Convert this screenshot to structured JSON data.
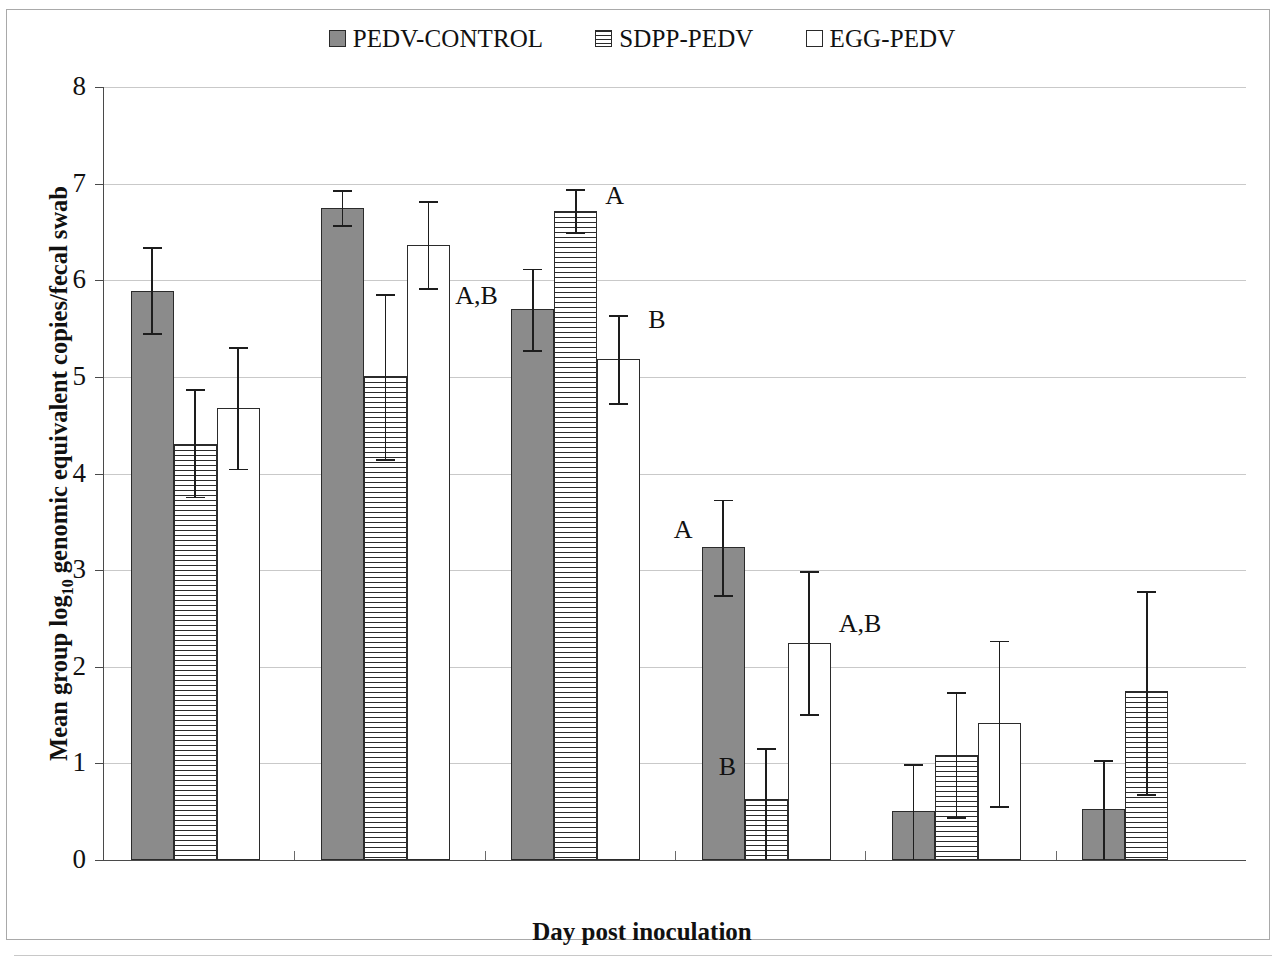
{
  "legend": {
    "items": [
      {
        "label": "PEDV-CONTROL",
        "swatch": "solid-gray-square-icon"
      },
      {
        "label": "SDPP-PEDV",
        "swatch": "horizontal-striped-square-icon"
      },
      {
        "label": "EGG-PEDV",
        "swatch": "empty-white-square-icon"
      }
    ]
  },
  "axes": {
    "y_title_main": "Mean group log",
    "y_title_sub": "10",
    "y_title_tail": " genomic equivalent copies/fecal swab",
    "x_title": "Day post inoculation",
    "y_ticks": [
      "0",
      "1",
      "2",
      "3",
      "4",
      "5",
      "6",
      "7",
      "8"
    ],
    "x_ticks": [
      "3",
      "5",
      "7",
      "14",
      "21",
      "28"
    ]
  },
  "chart_data": {
    "type": "bar",
    "title": "",
    "xlabel": "Day post inoculation",
    "ylabel": "Mean group log10 genomic equivalent copies/fecal swab",
    "ylim": [
      0,
      8
    ],
    "ytick_step": 1,
    "grid": true,
    "legend_position": "top-center",
    "categories": [
      "3",
      "5",
      "7",
      "14",
      "21",
      "28"
    ],
    "series": [
      {
        "name": "PEDV-CONTROL",
        "fill": "solid-gray",
        "color": "#8b8b8b",
        "values": [
          5.89,
          6.75,
          5.7,
          3.24,
          0.51,
          0.53
        ],
        "err_low": [
          5.45,
          6.57,
          5.28,
          2.74,
          0.0,
          0.0
        ],
        "err_high": [
          6.34,
          6.93,
          6.12,
          3.73,
          0.99,
          1.03
        ],
        "annotations": [
          "",
          "",
          "A,B",
          "A",
          "",
          ""
        ]
      },
      {
        "name": "SDPP-PEDV",
        "fill": "horizontal-stripes",
        "color": "#ffffff",
        "values": [
          4.31,
          5.01,
          6.72,
          0.63,
          1.09,
          1.75
        ],
        "err_low": [
          3.76,
          4.15,
          6.5,
          0.0,
          0.44,
          0.68
        ],
        "err_high": [
          4.87,
          5.86,
          6.94,
          1.16,
          1.74,
          2.78
        ],
        "annotations": [
          "",
          "",
          "A",
          "B",
          "",
          ""
        ]
      },
      {
        "name": "EGG-PEDV",
        "fill": "empty-white",
        "color": "#ffffff",
        "values": [
          4.68,
          6.37,
          5.19,
          2.25,
          1.42,
          null
        ],
        "err_low": [
          4.05,
          5.92,
          4.73,
          1.51,
          0.56,
          null
        ],
        "err_high": [
          5.31,
          6.82,
          5.64,
          2.99,
          2.27,
          null
        ],
        "annotations": [
          "",
          "",
          "B",
          "A,B",
          "",
          ""
        ]
      }
    ]
  }
}
